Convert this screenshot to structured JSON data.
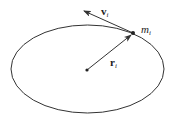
{
  "diagram": {
    "type": "orbit-vector-diagram",
    "labels": {
      "velocity": "v",
      "velocity_sub": "i",
      "position": "r",
      "position_sub": "i",
      "mass": "m",
      "mass_sub": "i"
    },
    "ellipse": {
      "cx": 87.5,
      "cy": 69,
      "rx": 76.5,
      "ry": 44
    },
    "center_point": {
      "x": 87,
      "y": 70
    },
    "mass_point": {
      "x": 133,
      "y": 33
    },
    "velocity_tip": {
      "x": 84,
      "y": 11
    },
    "stroke_color": "#333333"
  }
}
